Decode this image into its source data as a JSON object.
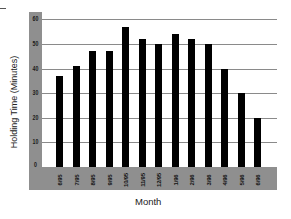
{
  "chart_data": {
    "type": "bar",
    "title": "",
    "xlabel": "Month",
    "ylabel": "Holding Time (Minutes)",
    "categories": [
      "6/95",
      "7/95",
      "8/95",
      "9/95",
      "10/95",
      "11/95",
      "12/95",
      "1/96",
      "2/96",
      "3/96",
      "4/96",
      "5/96",
      "6/96"
    ],
    "values": [
      37,
      41,
      47,
      47,
      57,
      52,
      50,
      54,
      52,
      50,
      40,
      30,
      20
    ],
    "ylim": [
      0,
      60
    ],
    "yticks": [
      "0",
      "10",
      "20",
      "30",
      "40",
      "50",
      "60"
    ],
    "grid": true,
    "legend": null,
    "colors": {
      "bar": "#000000",
      "frame": "#8f8f8f",
      "grid": "#8a8a8a",
      "plot_bg": "#ffffff"
    }
  }
}
